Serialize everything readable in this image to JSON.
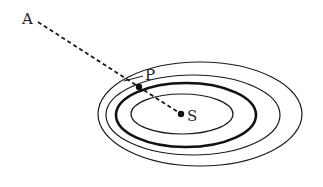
{
  "diagram": {
    "labels": {
      "A": "A",
      "P": "P",
      "S": "S"
    },
    "colors": {
      "stroke": "#1a1a1a",
      "background": "#ffffff"
    },
    "ellipses": [
      {
        "name": "outer-ellipse",
        "cx": 200,
        "cy": 114,
        "rx": 102,
        "ry": 52,
        "stroke_width": 1.2
      },
      {
        "name": "second-ellipse",
        "cx": 193,
        "cy": 115,
        "rx": 87,
        "ry": 40,
        "stroke_width": 1.2
      },
      {
        "name": "thick-ellipse",
        "cx": 186,
        "cy": 115,
        "rx": 70,
        "ry": 32,
        "stroke_width": 2.6
      },
      {
        "name": "inner-ellipse",
        "cx": 182,
        "cy": 114,
        "rx": 51,
        "ry": 20,
        "stroke_width": 1.2
      }
    ],
    "points": {
      "S": {
        "x": 181,
        "y": 114
      },
      "P": {
        "x": 139,
        "y": 87
      },
      "A_line_start": {
        "x": 38,
        "y": 22
      }
    }
  }
}
